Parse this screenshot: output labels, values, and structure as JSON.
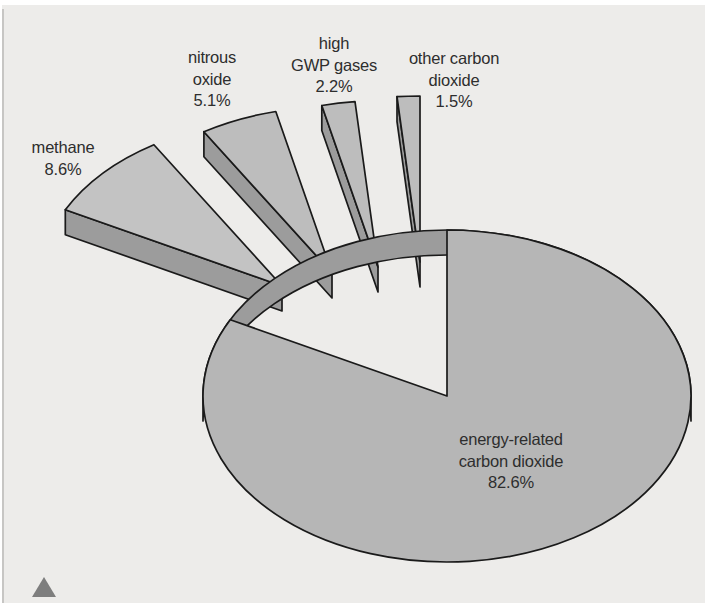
{
  "chart_data": {
    "type": "pie",
    "style": "3d-exploded",
    "title": "",
    "unit": "%",
    "legend": "none",
    "categories": [
      "energy-related carbon dioxide",
      "methane",
      "nitrous oxide",
      "high GWP gases",
      "other carbon dioxide"
    ],
    "values": [
      82.6,
      8.6,
      5.1,
      2.2,
      1.5
    ],
    "slices": [
      {
        "name": "energy-related carbon dioxide",
        "value": 82.6,
        "label_lines": [
          "energy-related",
          "carbon dioxide",
          "82.6%"
        ]
      },
      {
        "name": "methane",
        "value": 8.6,
        "label_lines": [
          "methane",
          "8.6%",
          ""
        ]
      },
      {
        "name": "nitrous oxide",
        "value": 5.1,
        "label_lines": [
          "nitrous",
          "oxide",
          "5.1%"
        ]
      },
      {
        "name": "high GWP gases",
        "value": 2.2,
        "label_lines": [
          "high",
          "GWP gases",
          "2.2%"
        ]
      },
      {
        "name": "other carbon dioxide",
        "value": 1.5,
        "label_lines": [
          "other carbon",
          "dioxide",
          "1.5%"
        ]
      }
    ],
    "colors": {
      "background": "#edecea",
      "slice_top_main": "#b6b6b6",
      "slice_top_methane": "#c3c3c3",
      "slice_top_small": "#bdbdbd",
      "slice_side": "#9c9c9c",
      "outline": "#1a1a1a",
      "label_text": "#2e2e2e",
      "corner_triangle": "#7e7e7e"
    }
  }
}
